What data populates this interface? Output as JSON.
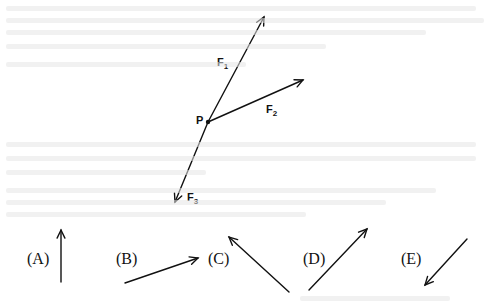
{
  "figure": {
    "point_label": "P",
    "point": {
      "x": 208,
      "y": 122
    },
    "forces": [
      {
        "id": "F1",
        "label": "F",
        "subscript": "1",
        "tip": {
          "x": 264,
          "y": 17
        },
        "label_pos": {
          "x": 217,
          "y": 66
        }
      },
      {
        "id": "F2",
        "label": "F",
        "subscript": "2",
        "tip": {
          "x": 303,
          "y": 80
        },
        "label_pos": {
          "x": 266,
          "y": 113
        }
      },
      {
        "id": "F3",
        "label": "F",
        "subscript": "3",
        "tip": {
          "x": 175,
          "y": 202
        },
        "label_pos": {
          "x": 187,
          "y": 201
        }
      }
    ]
  },
  "choices": [
    {
      "label": "(A)",
      "label_pos": {
        "x": 27,
        "y": 264
      },
      "from": {
        "x": 61,
        "y": 282
      },
      "to": {
        "x": 61,
        "y": 230
      }
    },
    {
      "label": "(B)",
      "label_pos": {
        "x": 116,
        "y": 264
      },
      "from": {
        "x": 125,
        "y": 283
      },
      "to": {
        "x": 198,
        "y": 258
      }
    },
    {
      "label": "(C)",
      "label_pos": {
        "x": 208,
        "y": 264
      },
      "from": {
        "x": 289,
        "y": 292
      },
      "to": {
        "x": 229,
        "y": 237
      }
    },
    {
      "label": "(D)",
      "label_pos": {
        "x": 303,
        "y": 264
      },
      "from": {
        "x": 309,
        "y": 290
      },
      "to": {
        "x": 367,
        "y": 229
      }
    },
    {
      "label": "(E)",
      "label_pos": {
        "x": 401,
        "y": 264
      },
      "from": {
        "x": 467,
        "y": 239
      },
      "to": {
        "x": 425,
        "y": 285
      }
    }
  ],
  "colors": {
    "ink": "#111111",
    "background": "#ffffff",
    "bleed_through": "#e6e6e6"
  }
}
